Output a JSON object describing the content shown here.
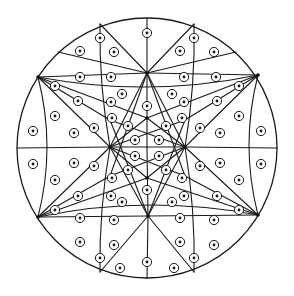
{
  "diagram": {
    "title": "Circle subdivided into regions, each marked with a dot-in-circle symbol",
    "colors": {
      "stroke": "#1a1a1a",
      "background": "#ffffff",
      "hub": "#111111"
    },
    "marker_symbol": "dot-in-circle",
    "marker_count": 72
  }
}
